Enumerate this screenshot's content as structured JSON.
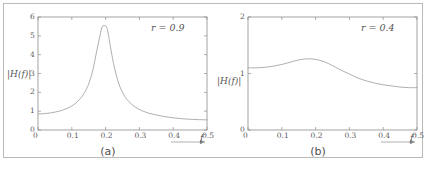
{
  "figure": {
    "background": "#ffffff",
    "frame_color": "#b9b9b9",
    "curve_color": "#9a9a9a",
    "axis_color": "#8d8d8d"
  },
  "panels": [
    {
      "id": "a",
      "caption": "(a)",
      "param_label": "r = 0.9",
      "ylabel": "|H(f)|",
      "xlabel": "f",
      "chart_data": {
        "type": "line",
        "title": "",
        "xlabel": "f",
        "ylabel": "|H(f)|",
        "xlim": [
          0,
          0.5
        ],
        "ylim": [
          0,
          6
        ],
        "xticks": [
          0,
          0.1,
          0.2,
          0.3,
          0.4,
          0.5
        ],
        "xticklabels": [
          "0",
          "0.1",
          "0.2",
          "0.3",
          "0.4",
          "0.5"
        ],
        "yticks": [
          0,
          1,
          2,
          3,
          4,
          5,
          6
        ],
        "yticklabels": [
          "0",
          "1",
          "2",
          "3",
          "4",
          "5",
          "6"
        ],
        "grid": false,
        "legend": "none",
        "annotations": [
          "r = 0.9"
        ],
        "series": [
          {
            "name": "|H(f)| for r = 0.9",
            "x": [
              0,
              0.0125,
              0.025,
              0.0375,
              0.05,
              0.0625,
              0.075,
              0.0875,
              0.1,
              0.1125,
              0.125,
              0.1375,
              0.15,
              0.1625,
              0.175,
              0.1875,
              0.19,
              0.1925,
              0.195,
              0.1975,
              0.2,
              0.2025,
              0.205,
              0.2075,
              0.21,
              0.2125,
              0.225,
              0.2375,
              0.25,
              0.2625,
              0.275,
              0.2875,
              0.3,
              0.3125,
              0.325,
              0.3375,
              0.35,
              0.375,
              0.4,
              0.425,
              0.45,
              0.475,
              0.5
            ],
            "y": [
              0.85,
              0.86,
              0.88,
              0.91,
              0.95,
              1.0,
              1.07,
              1.16,
              1.28,
              1.44,
              1.66,
              1.98,
              2.45,
              3.2,
              4.3,
              5.35,
              5.48,
              5.53,
              5.55,
              5.55,
              5.53,
              5.47,
              5.35,
              5.15,
              4.9,
              4.6,
              3.4,
              2.55,
              2.0,
              1.64,
              1.4,
              1.22,
              1.09,
              0.99,
              0.91,
              0.85,
              0.8,
              0.71,
              0.65,
              0.6,
              0.57,
              0.55,
              0.54
            ]
          }
        ]
      }
    },
    {
      "id": "b",
      "caption": "(b)",
      "param_label": "r = 0.4",
      "ylabel": "|H(f)|",
      "xlabel": "f",
      "chart_data": {
        "type": "line",
        "title": "",
        "xlabel": "f",
        "ylabel": "|H(f)|",
        "xlim": [
          0,
          0.5
        ],
        "ylim": [
          0,
          2
        ],
        "xticks": [
          0,
          0.1,
          0.2,
          0.3,
          0.4,
          0.5
        ],
        "xticklabels": [
          "0",
          "0.1",
          "0.2",
          "0.3",
          "0.4",
          "0.5"
        ],
        "yticks": [
          0,
          1,
          2
        ],
        "yticklabels": [
          "0",
          "1",
          "2"
        ],
        "grid": false,
        "legend": "none",
        "annotations": [
          "r = 0.4"
        ],
        "series": [
          {
            "name": "|H(f)| for r = 0.4",
            "x": [
              0,
              0.025,
              0.05,
              0.075,
              0.1,
              0.125,
              0.15,
              0.175,
              0.2,
              0.225,
              0.25,
              0.275,
              0.3,
              0.325,
              0.35,
              0.375,
              0.4,
              0.425,
              0.45,
              0.475,
              0.5
            ],
            "y": [
              1.1,
              1.1,
              1.11,
              1.13,
              1.16,
              1.2,
              1.24,
              1.26,
              1.25,
              1.21,
              1.14,
              1.06,
              0.99,
              0.92,
              0.87,
              0.83,
              0.8,
              0.78,
              0.76,
              0.75,
              0.75
            ]
          }
        ]
      }
    }
  ]
}
